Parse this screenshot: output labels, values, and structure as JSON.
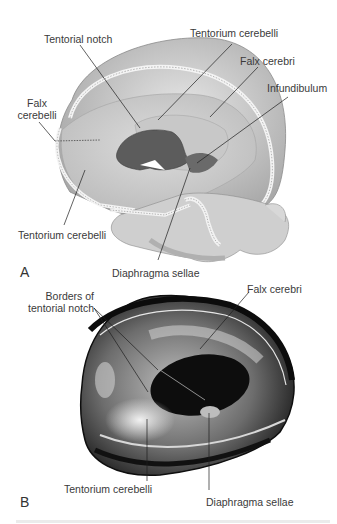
{
  "figure": {
    "panels": [
      {
        "id": "A",
        "letter": "A",
        "type": "illustration",
        "subject": "skull with dural reflections (cutaway)",
        "labels": {
          "tentorial_notch": "Tentorial notch",
          "tentorium_cerebelli_top": "Tentorium cerebelli",
          "falx_cerebri": "Falx cerebri",
          "infundibulum": "Infundibulum",
          "falx_cerebelli_line1": "Falx",
          "falx_cerebelli_line2": "cerebelli",
          "tentorium_cerebelli_bottom": "Tentorium cerebelli",
          "diaphragma_sellae": "Diaphragma sellae"
        }
      },
      {
        "id": "B",
        "letter": "B",
        "type": "photograph",
        "subject": "cadaveric dura mater specimen",
        "labels": {
          "borders_line1": "Borders of",
          "borders_line2": "tentorial notch",
          "falx_cerebri": "Falx cerebri",
          "tentorium_cerebelli": "Tentorium cerebelli",
          "diaphragma_sellae": "Diaphragma sellae"
        }
      }
    ],
    "colors": {
      "illustration_light": "#d9d9d9",
      "illustration_mid": "#b5b5b5",
      "illustration_dark": "#5e5e5e",
      "photo_dark": "#1a1a1a",
      "photo_light": "#cfcfcf",
      "leader_line": "#1e1e1e"
    }
  }
}
